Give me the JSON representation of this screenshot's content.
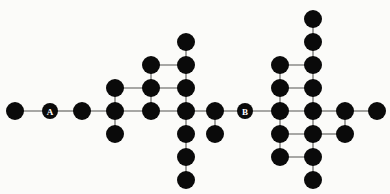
{
  "figure": {
    "title": "",
    "background_color": "#fbfbf9",
    "node_color": "#0a0a0a",
    "edge_color": "#8b8b88",
    "label_color": "#ffffff",
    "node_radius": 9,
    "label_node_radius": 8
  },
  "chart_data": {
    "type": "diagram",
    "subtype": "node-link-graph",
    "title": "",
    "xlabel": "",
    "ylabel": "",
    "grid": false,
    "legend": null,
    "xlim": [
      0,
      390
    ],
    "ylim": [
      0,
      194
    ],
    "labeled_nodes": [
      "A",
      "B"
    ],
    "node_count": 38,
    "edge_count": 42,
    "nodes": [
      {
        "id": "n0",
        "x": 15,
        "y": 111,
        "label": "",
        "r": 9
      },
      {
        "id": "A",
        "x": 50,
        "y": 111,
        "label": "A",
        "r": 8
      },
      {
        "id": "n2",
        "x": 82,
        "y": 111,
        "label": "",
        "r": 9
      },
      {
        "id": "n3",
        "x": 115,
        "y": 88,
        "label": "",
        "r": 9
      },
      {
        "id": "n4",
        "x": 115,
        "y": 111,
        "label": "",
        "r": 9
      },
      {
        "id": "n5",
        "x": 115,
        "y": 134,
        "label": "",
        "r": 9
      },
      {
        "id": "n6",
        "x": 151,
        "y": 65,
        "label": "",
        "r": 9
      },
      {
        "id": "n7",
        "x": 151,
        "y": 88,
        "label": "",
        "r": 9
      },
      {
        "id": "n8",
        "x": 151,
        "y": 111,
        "label": "",
        "r": 9
      },
      {
        "id": "n9",
        "x": 186,
        "y": 42,
        "label": "",
        "r": 9
      },
      {
        "id": "n10",
        "x": 186,
        "y": 65,
        "label": "",
        "r": 9
      },
      {
        "id": "n11",
        "x": 186,
        "y": 88,
        "label": "",
        "r": 9
      },
      {
        "id": "n12",
        "x": 186,
        "y": 111,
        "label": "",
        "r": 9
      },
      {
        "id": "n13",
        "x": 186,
        "y": 134,
        "label": "",
        "r": 9
      },
      {
        "id": "n14",
        "x": 186,
        "y": 157,
        "label": "",
        "r": 9
      },
      {
        "id": "n15",
        "x": 186,
        "y": 180,
        "label": "",
        "r": 9
      },
      {
        "id": "n16",
        "x": 215,
        "y": 111,
        "label": "",
        "r": 9
      },
      {
        "id": "n17",
        "x": 215,
        "y": 134,
        "label": "",
        "r": 9
      },
      {
        "id": "B",
        "x": 245,
        "y": 111,
        "label": "B",
        "r": 8
      },
      {
        "id": "n19",
        "x": 280,
        "y": 65,
        "label": "",
        "r": 9
      },
      {
        "id": "n20",
        "x": 280,
        "y": 88,
        "label": "",
        "r": 9
      },
      {
        "id": "n21",
        "x": 280,
        "y": 111,
        "label": "",
        "r": 9
      },
      {
        "id": "n22",
        "x": 280,
        "y": 134,
        "label": "",
        "r": 9
      },
      {
        "id": "n23",
        "x": 280,
        "y": 157,
        "label": "",
        "r": 9
      },
      {
        "id": "n24",
        "x": 313,
        "y": 19,
        "label": "",
        "r": 9
      },
      {
        "id": "n25",
        "x": 313,
        "y": 42,
        "label": "",
        "r": 9
      },
      {
        "id": "n26",
        "x": 313,
        "y": 65,
        "label": "",
        "r": 9
      },
      {
        "id": "n27",
        "x": 313,
        "y": 88,
        "label": "",
        "r": 9
      },
      {
        "id": "n28",
        "x": 313,
        "y": 111,
        "label": "",
        "r": 9
      },
      {
        "id": "n29",
        "x": 313,
        "y": 134,
        "label": "",
        "r": 9
      },
      {
        "id": "n30",
        "x": 313,
        "y": 157,
        "label": "",
        "r": 9
      },
      {
        "id": "n31",
        "x": 313,
        "y": 180,
        "label": "",
        "r": 9
      },
      {
        "id": "n32",
        "x": 345,
        "y": 111,
        "label": "",
        "r": 9
      },
      {
        "id": "n33",
        "x": 345,
        "y": 134,
        "label": "",
        "r": 9
      },
      {
        "id": "n34",
        "x": 377,
        "y": 111,
        "label": "",
        "r": 9
      }
    ],
    "edges": [
      [
        "n0",
        "A"
      ],
      [
        "A",
        "n2"
      ],
      [
        "n2",
        "n4"
      ],
      [
        "n3",
        "n4"
      ],
      [
        "n4",
        "n5"
      ],
      [
        "n4",
        "n8"
      ],
      [
        "n3",
        "n7"
      ],
      [
        "n6",
        "n7"
      ],
      [
        "n7",
        "n8"
      ],
      [
        "n6",
        "n10"
      ],
      [
        "n7",
        "n11"
      ],
      [
        "n8",
        "n12"
      ],
      [
        "n9",
        "n10"
      ],
      [
        "n10",
        "n11"
      ],
      [
        "n11",
        "n12"
      ],
      [
        "n12",
        "n13"
      ],
      [
        "n13",
        "n14"
      ],
      [
        "n14",
        "n15"
      ],
      [
        "n12",
        "n16"
      ],
      [
        "n16",
        "n17"
      ],
      [
        "n16",
        "B"
      ],
      [
        "B",
        "n21"
      ],
      [
        "n19",
        "n20"
      ],
      [
        "n20",
        "n21"
      ],
      [
        "n21",
        "n22"
      ],
      [
        "n22",
        "n23"
      ],
      [
        "n19",
        "n26"
      ],
      [
        "n20",
        "n27"
      ],
      [
        "n21",
        "n28"
      ],
      [
        "n22",
        "n29"
      ],
      [
        "n23",
        "n30"
      ],
      [
        "n24",
        "n25"
      ],
      [
        "n25",
        "n26"
      ],
      [
        "n26",
        "n27"
      ],
      [
        "n27",
        "n28"
      ],
      [
        "n28",
        "n29"
      ],
      [
        "n29",
        "n30"
      ],
      [
        "n30",
        "n31"
      ],
      [
        "n28",
        "n32"
      ],
      [
        "n32",
        "n33"
      ],
      [
        "n29",
        "n33"
      ],
      [
        "n32",
        "n34"
      ]
    ]
  }
}
